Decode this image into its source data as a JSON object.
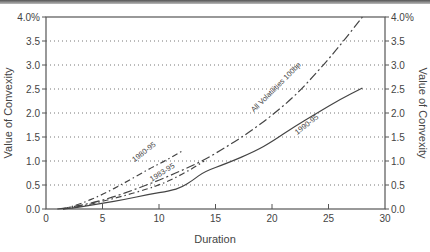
{
  "chart_data": {
    "type": "line",
    "title": "",
    "xlabel": "Duration",
    "ylabel": "Value of Convexity",
    "ylabel_right": "Value of Convexity",
    "xlim": [
      0,
      30
    ],
    "ylim": [
      0,
      4.0
    ],
    "x_ticks": [
      0,
      5,
      10,
      15,
      20,
      25,
      30
    ],
    "x_tick_labels": [
      "0",
      "5",
      "10",
      "15",
      "20",
      "25",
      "30"
    ],
    "y_ticks": [
      0,
      0.5,
      1.0,
      1.5,
      2.0,
      2.5,
      3.0,
      3.5,
      4.0
    ],
    "y_tick_labels": [
      "0.0",
      "0.5",
      "1.0",
      "1.5",
      "2.0",
      "2.5",
      "3.0",
      "3.5",
      "4.0%"
    ],
    "grid": "horizontal dotted",
    "legend": "inline curve labels",
    "series": [
      {
        "name": "All Volatilities 100bp",
        "style": "long-dash",
        "x": [
          1,
          2,
          4,
          6,
          8,
          10,
          12,
          14,
          16,
          18,
          20,
          22,
          24,
          26,
          28
        ],
        "y": [
          0.0,
          0.03,
          0.12,
          0.25,
          0.42,
          0.6,
          0.8,
          1.02,
          1.3,
          1.6,
          1.95,
          2.35,
          2.85,
          3.4,
          4.0
        ],
        "label_pos": {
          "x": 20.5,
          "y": 2.5,
          "angle": -45
        }
      },
      {
        "name": "1990-95",
        "style": "solid",
        "x": [
          1.5,
          3,
          5,
          7,
          9,
          11,
          12,
          13,
          14,
          16,
          18.5,
          20,
          22,
          24,
          26,
          28
        ],
        "y": [
          0.0,
          0.04,
          0.12,
          0.2,
          0.3,
          0.38,
          0.45,
          0.6,
          0.78,
          0.95,
          1.2,
          1.4,
          1.72,
          2.0,
          2.28,
          2.52
        ],
        "label_pos": {
          "x": 23.2,
          "y": 1.72,
          "angle": -38
        }
      },
      {
        "name": "1983-95",
        "style": "dash-dot",
        "x": [
          1.5,
          3,
          5,
          7,
          9,
          10,
          11,
          12,
          13,
          14
        ],
        "y": [
          0.0,
          0.05,
          0.16,
          0.28,
          0.42,
          0.5,
          0.6,
          0.72,
          0.85,
          1.0
        ],
        "label_pos": {
          "x": 10.4,
          "y": 0.72,
          "angle": -32
        }
      },
      {
        "name": "1980-95",
        "style": "dash-dot",
        "x": [
          1.5,
          3,
          5,
          7,
          9,
          10.5,
          12
        ],
        "y": [
          0.0,
          0.1,
          0.3,
          0.55,
          0.82,
          1.0,
          1.2
        ],
        "label_pos": {
          "x": 8.8,
          "y": 1.15,
          "angle": -38
        }
      }
    ]
  },
  "labels": {
    "xlabel": "Duration",
    "ylabel_left": "Value of Convexity",
    "ylabel_right": "Value of Convexity"
  }
}
